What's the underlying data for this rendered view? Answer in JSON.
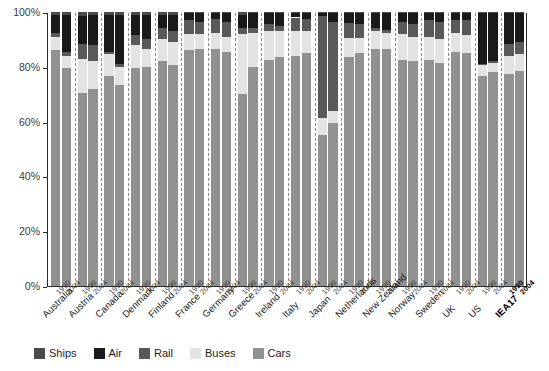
{
  "chart_data": {
    "type": "bar",
    "subtype": "stacked-100-percent-column",
    "title": "",
    "xlabel": "",
    "ylabel": "",
    "ylim": [
      0,
      100
    ],
    "ytick_labels": [
      "0%",
      "20%",
      "40%",
      "60%",
      "80%",
      "100%"
    ],
    "ytick_values": [
      0,
      20,
      40,
      60,
      80,
      100
    ],
    "grid": false,
    "legend_position": "bottom",
    "legend_order": [
      "Ships",
      "Air",
      "Rail",
      "Buses",
      "Cars"
    ],
    "stack_order_bottom_to_top": [
      "Cars",
      "Buses",
      "Rail",
      "Air",
      "Ships"
    ],
    "categories": [
      "Australia",
      "Austria",
      "Canada",
      "Denmark",
      "Finland",
      "France",
      "Germany",
      "Greece",
      "Ireland",
      "Italy",
      "Japan",
      "Netherlands",
      "New Zealand",
      "Norway",
      "Sweden",
      "UK",
      "US",
      "IEA17"
    ],
    "subcategories": [
      "1990",
      "2004"
    ],
    "series": [
      {
        "name": "Cars",
        "color": "#919191",
        "values": [
          [
            86.0,
            79.5
          ],
          [
            70.5,
            72.0
          ],
          [
            76.5,
            73.5
          ],
          [
            79.5,
            80.0
          ],
          [
            82.0,
            80.5
          ],
          [
            86.0,
            86.5
          ],
          [
            86.5,
            85.5
          ],
          [
            70.0,
            80.0
          ],
          [
            82.5,
            83.5
          ],
          [
            84.0,
            85.0
          ],
          [
            55.0,
            59.5
          ],
          [
            83.5,
            85.0
          ],
          [
            86.5,
            86.5
          ],
          [
            82.5,
            82.0
          ],
          [
            82.5,
            81.5
          ],
          [
            85.5,
            85.0
          ],
          [
            76.5,
            78.0
          ],
          [
            77.5,
            78.5
          ]
        ]
      },
      {
        "name": "Buses",
        "color": "#e3e3e3",
        "values": [
          [
            5.0,
            4.5
          ],
          [
            12.5,
            10.0
          ],
          [
            8.0,
            6.5
          ],
          [
            8.5,
            6.5
          ],
          [
            8.0,
            8.5
          ],
          [
            6.0,
            5.5
          ],
          [
            6.0,
            5.5
          ],
          [
            22.0,
            12.5
          ],
          [
            10.5,
            9.5
          ],
          [
            9.0,
            8.0
          ],
          [
            6.5,
            4.5
          ],
          [
            7.0,
            5.5
          ],
          [
            6.5,
            6.0
          ],
          [
            9.5,
            9.0
          ],
          [
            8.5,
            8.5
          ],
          [
            7.0,
            6.5
          ],
          [
            4.0,
            3.5
          ],
          [
            6.5,
            6.0
          ]
        ]
      },
      {
        "name": "Rail",
        "color": "#595959",
        "values": [
          [
            1.5,
            1.5
          ],
          [
            5.5,
            6.0
          ],
          [
            1.0,
            1.0
          ],
          [
            3.5,
            3.5
          ],
          [
            4.0,
            4.0
          ],
          [
            5.0,
            4.5
          ],
          [
            5.0,
            5.5
          ],
          [
            2.0,
            1.5
          ],
          [
            2.5,
            2.0
          ],
          [
            5.0,
            4.5
          ],
          [
            37.0,
            32.5
          ],
          [
            5.5,
            5.0
          ],
          [
            1.0,
            1.0
          ],
          [
            4.5,
            4.5
          ],
          [
            6.0,
            6.5
          ],
          [
            4.5,
            5.5
          ],
          [
            0.5,
            0.5
          ],
          [
            4.5,
            4.5
          ]
        ]
      },
      {
        "name": "Air",
        "color": "#1a1a1a",
        "values": [
          [
            6.5,
            13.5
          ],
          [
            10.0,
            11.0
          ],
          [
            13.5,
            18.0
          ],
          [
            7.5,
            9.0
          ],
          [
            5.0,
            6.0
          ],
          [
            2.5,
            3.0
          ],
          [
            2.0,
            3.0
          ],
          [
            5.0,
            5.5
          ],
          [
            4.0,
            4.5
          ],
          [
            1.5,
            2.0
          ],
          [
            1.0,
            3.0
          ],
          [
            3.5,
            4.0
          ],
          [
            5.5,
            6.0
          ],
          [
            3.0,
            4.0
          ],
          [
            2.5,
            3.0
          ],
          [
            2.5,
            2.5
          ],
          [
            18.5,
            17.5
          ],
          [
            11.0,
            10.5
          ]
        ]
      },
      {
        "name": "Ships",
        "color": "#4a4a4a",
        "values": [
          [
            1.0,
            1.0
          ],
          [
            1.5,
            1.0
          ],
          [
            1.0,
            1.0
          ],
          [
            1.0,
            1.0
          ],
          [
            1.0,
            1.0
          ],
          [
            0.5,
            0.5
          ],
          [
            0.5,
            0.5
          ],
          [
            1.0,
            0.5
          ],
          [
            0.5,
            0.5
          ],
          [
            0.5,
            0.5
          ],
          [
            0.5,
            0.5
          ],
          [
            0.5,
            0.5
          ],
          [
            0.5,
            0.5
          ],
          [
            0.5,
            0.5
          ],
          [
            0.5,
            0.5
          ],
          [
            0.5,
            0.5
          ],
          [
            0.5,
            0.5
          ],
          [
            0.5,
            0.5
          ]
        ]
      }
    ]
  },
  "axis": {
    "y_ticks": [
      "100%",
      "80%",
      "60%",
      "40%",
      "20%",
      "0%"
    ]
  },
  "legend": {
    "items": [
      {
        "label": "Ships",
        "color": "#4a4a4a"
      },
      {
        "label": "Air",
        "color": "#1a1a1a"
      },
      {
        "label": "Rail",
        "color": "#595959"
      },
      {
        "label": "Buses",
        "color": "#e3e3e3"
      },
      {
        "label": "Cars",
        "color": "#919191"
      }
    ]
  }
}
